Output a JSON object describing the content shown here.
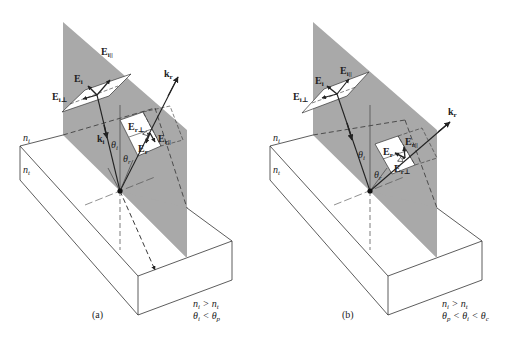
{
  "figure": {
    "colors": {
      "plane": "#a9a9a9",
      "line": "#333333",
      "background": "#ffffff"
    }
  },
  "panels": [
    {
      "id": "a",
      "caption": "(a)",
      "medium_labels": {
        "incident": "n_i",
        "transmitted": "n_t"
      },
      "condition_line1": "n_i > n_t",
      "condition_line2": "θ_i < θ_p",
      "vectors": {
        "E_i": "E_i",
        "E_i_parallel": "E_i||",
        "E_i_perp": "E_i⊥",
        "k_i": "k_i",
        "k_r": "k_r",
        "E_r": "E_r",
        "E_r_parallel": "E_r||",
        "E_r_perp": "E_r⊥"
      },
      "angles": {
        "theta_i": "θ_i",
        "theta_r": "θ_r"
      },
      "transmitted_ray": true
    },
    {
      "id": "b",
      "caption": "(b)",
      "medium_labels": {
        "incident": "n_i",
        "transmitted": "n_t"
      },
      "condition_line1": "n_i > n_t",
      "condition_line2": "θ_p < θ_i < θ_c",
      "vectors": {
        "E_i": "E_i",
        "E_i_parallel": "E_i||",
        "E_i_perp": "E_i⊥",
        "k_r": "k_r",
        "E_r": "E_r",
        "E_r_parallel": "E_r||",
        "E_r_perp": "E_r⊥"
      },
      "angles": {
        "theta_i": "θ_i",
        "theta_r": "θ_r"
      },
      "transmitted_ray": false
    }
  ],
  "text": {
    "a_cond1_n": "n",
    "sub_i": "i",
    "sub_t": "t",
    "sub_r": "r",
    "sub_p": "p",
    "sub_c": "c",
    "gt": " > ",
    "lt": " < ",
    "theta": "θ",
    "E": "E",
    "k": "k",
    "par": "||",
    "perp": "⊥",
    "cap_a": "(a)",
    "cap_b": "(b)"
  }
}
